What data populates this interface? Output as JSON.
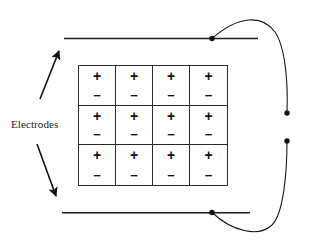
{
  "figure": {
    "background_color": "#ffffff",
    "line_color": "#1a1a1a",
    "labels": {
      "electrodes": "Electrodes"
    },
    "electrodes": [
      {
        "name": "top-electrode",
        "x1": 64,
        "y1": 38,
        "x2": 258,
        "y2": 38
      },
      {
        "name": "bottom-electrode",
        "x1": 62,
        "y1": 213,
        "x2": 250,
        "y2": 213
      }
    ],
    "junction_dots": [
      {
        "name": "top-junction",
        "cx": 212,
        "cy": 38.5,
        "r": 2.6
      },
      {
        "name": "bottom-junction",
        "cx": 212,
        "cy": 212.5,
        "r": 2.6
      },
      {
        "name": "upper-terminal",
        "cx": 287,
        "cy": 113,
        "r": 2.6
      },
      {
        "name": "lower-terminal",
        "cx": 287,
        "cy": 141,
        "r": 2.6
      }
    ],
    "wires": [
      {
        "name": "top-wire",
        "path": "M 212 38.5 C 238 16, 262 14, 275 32 C 286 48, 288 86, 287 113"
      },
      {
        "name": "bottom-wire",
        "path": "M 212 212.5 C 232 231, 258 238, 272 225 C 284 213, 287 170, 287 141"
      }
    ],
    "arrows": [
      {
        "name": "upper-electrode-arrow",
        "x1": 40,
        "y1": 99,
        "x2": 60,
        "y2": 49
      },
      {
        "name": "lower-electrode-arrow",
        "x1": 37,
        "y1": 144,
        "x2": 58,
        "y2": 198
      }
    ],
    "grid": {
      "name": "charge-cell-array",
      "columns": 4,
      "rows": 3,
      "x": 78,
      "y": 65,
      "width": 150,
      "height": 121,
      "cells": [
        [
          {
            "positive": "+",
            "negative": "−"
          },
          {
            "positive": "+",
            "negative": "−"
          },
          {
            "positive": "+",
            "negative": "−"
          },
          {
            "positive": "+",
            "negative": "−"
          }
        ],
        [
          {
            "positive": "+",
            "negative": "−"
          },
          {
            "positive": "+",
            "negative": "−"
          },
          {
            "positive": "+",
            "negative": "−"
          },
          {
            "positive": "+",
            "negative": "−"
          }
        ],
        [
          {
            "positive": "+",
            "negative": "−"
          },
          {
            "positive": "+",
            "negative": "−"
          },
          {
            "positive": "+",
            "negative": "−"
          },
          {
            "positive": "+",
            "negative": "−"
          }
        ]
      ]
    }
  }
}
